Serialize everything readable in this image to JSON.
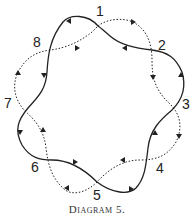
{
  "diagram": {
    "caption": "Diagram 5.",
    "nodes": [
      {
        "id": "1",
        "label": "1"
      },
      {
        "id": "2",
        "label": "2"
      },
      {
        "id": "3",
        "label": "3"
      },
      {
        "id": "4",
        "label": "4"
      },
      {
        "id": "5",
        "label": "5"
      },
      {
        "id": "6",
        "label": "6"
      },
      {
        "id": "7",
        "label": "7"
      },
      {
        "id": "8",
        "label": "8"
      }
    ],
    "curves": [
      {
        "style": "solid",
        "description": "closed wavy loop through crossings 1-8, arrows counterclockwise"
      },
      {
        "style": "dotted",
        "description": "closed wavy loop through crossings 1-8, arrows clockwise"
      }
    ],
    "colors": {
      "ink": "#222222",
      "background": "#ffffff"
    }
  }
}
